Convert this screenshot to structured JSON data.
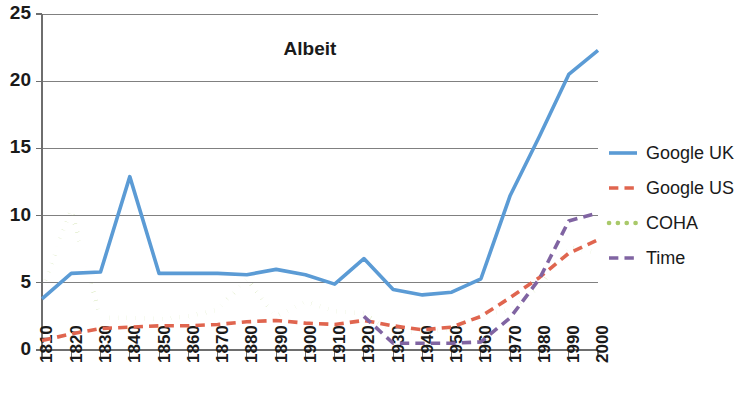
{
  "chart_data": {
    "type": "line",
    "title": "Albeit",
    "xlabel": "",
    "ylabel": "",
    "ylim": [
      0,
      25
    ],
    "yticks": [
      0,
      5,
      10,
      15,
      20,
      25
    ],
    "grid": true,
    "legend_position": "right",
    "x": [
      1810,
      1820,
      1830,
      1840,
      1850,
      1860,
      1870,
      1880,
      1890,
      1900,
      1910,
      1920,
      1930,
      1940,
      1950,
      1960,
      1970,
      1980,
      1990,
      2000
    ],
    "categories": [
      "1810",
      "1820",
      "1830",
      "1840",
      "1850",
      "1860",
      "1870",
      "1880",
      "1890",
      "1900",
      "1910",
      "1920",
      "1930",
      "1940",
      "1950",
      "1960",
      "1970",
      "1980",
      "1990",
      "2000"
    ],
    "series": [
      {
        "name": "Google UK",
        "color": "#5B9BD5",
        "style": "solid",
        "values": [
          3.8,
          5.7,
          5.8,
          12.9,
          5.7,
          5.7,
          5.7,
          5.6,
          6.0,
          5.6,
          4.9,
          6.8,
          4.5,
          4.1,
          4.3,
          5.3,
          11.5,
          15.9,
          20.5,
          22.3
        ]
      },
      {
        "name": "Google US",
        "color": "#E0654F",
        "style": "dashed",
        "values": [
          0.7,
          1.2,
          1.6,
          1.7,
          1.8,
          1.8,
          1.9,
          2.1,
          2.2,
          2.0,
          1.9,
          2.2,
          1.8,
          1.5,
          1.7,
          2.5,
          3.9,
          5.4,
          7.2,
          8.2
        ]
      },
      {
        "name": "COHA",
        "color": "#A9C96A",
        "style": "dotted",
        "values": [
          4.6,
          10.4,
          2.4,
          2.4,
          2.3,
          2.5,
          3.0,
          5.3,
          2.5,
          3.6,
          2.9,
          2.7,
          1.4,
          1.3,
          1.6,
          2.6,
          3.0,
          4.7,
          7.7,
          7.2
        ]
      },
      {
        "name": "Time",
        "color": "#8064A2",
        "style": "dashed",
        "values": [
          null,
          null,
          null,
          null,
          null,
          null,
          null,
          null,
          null,
          null,
          null,
          2.5,
          0.5,
          0.5,
          0.5,
          0.6,
          2.4,
          5.3,
          9.6,
          10.2
        ]
      }
    ]
  },
  "legend": {
    "items": [
      {
        "label": "Google UK"
      },
      {
        "label": "Google US"
      },
      {
        "label": "COHA"
      },
      {
        "label": "Time"
      }
    ]
  }
}
